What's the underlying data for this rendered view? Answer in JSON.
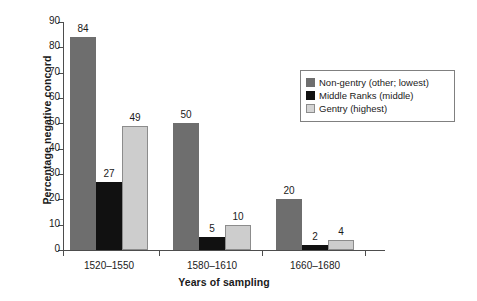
{
  "chart_data": {
    "type": "bar",
    "title": "",
    "xlabel": "Years of sampling",
    "ylabel": "Percentage negative concord",
    "categories": [
      "1520–1550",
      "1580–1610",
      "1660–1680"
    ],
    "series": [
      {
        "name": "Non-gentry (other; lowest)",
        "color": "#6e6e6e",
        "values": [
          84,
          50,
          20
        ]
      },
      {
        "name": "Middle Ranks (middle)",
        "color": "#111111",
        "values": [
          27,
          5,
          2
        ]
      },
      {
        "name": "Gentry (highest)",
        "color": "#cdcdcd",
        "values": [
          49,
          10,
          4
        ]
      }
    ],
    "ylim": [
      0,
      90
    ],
    "yticks": [
      0,
      10,
      20,
      30,
      40,
      50,
      60,
      70,
      80,
      90
    ],
    "ytick_labels": [
      "0",
      "10",
      "20",
      "30",
      "40",
      "50",
      "60",
      "70",
      "80",
      "90"
    ],
    "grid": false,
    "data_labels": true,
    "legend_position": "upper right"
  },
  "legend": {
    "items": [
      {
        "label": "Non-gentry (other; lowest)"
      },
      {
        "label": "Middle Ranks (middle)"
      },
      {
        "label": "Gentry (highest)"
      }
    ]
  }
}
